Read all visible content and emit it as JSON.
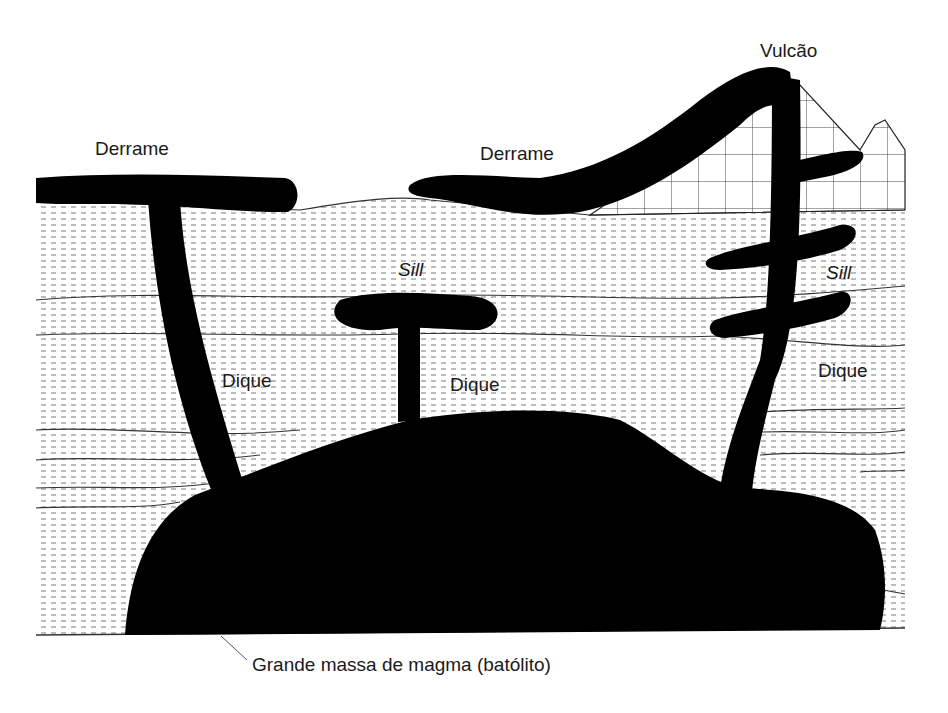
{
  "diagram": {
    "type": "geological-cross-section",
    "labels": {
      "vulcao": "Vulcão",
      "derrame_left": "Derrame",
      "derrame_right": "Derrame",
      "sill_center": "Sill",
      "sill_right": "Sill",
      "dique_left": "Dique",
      "dique_center": "Dique",
      "dique_right": "Dique",
      "batolito": "Grande massa de magma (batólito)"
    },
    "colors": {
      "magma": "#000000",
      "strata_line": "#333333",
      "background": "#ffffff",
      "text": "#1a1a1a"
    }
  }
}
